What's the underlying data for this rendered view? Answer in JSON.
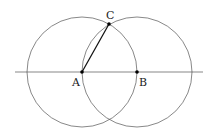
{
  "diagram": {
    "type": "geometric-construction",
    "points": {
      "A": {
        "label": "A",
        "x": 82,
        "y": 72
      },
      "B": {
        "label": "B",
        "x": 137,
        "y": 72
      },
      "C": {
        "label": "C",
        "x": 109,
        "y": 24
      }
    },
    "circles": [
      {
        "center": "A",
        "radius": 55
      },
      {
        "center": "B",
        "radius": 55
      }
    ],
    "line": {
      "x1": 15,
      "y1": 72,
      "x2": 203,
      "y2": 72
    },
    "segment": {
      "from": "A",
      "to": "C"
    },
    "colors": {
      "stroke": "#444444",
      "segment": "#111111",
      "point": "#000000"
    }
  }
}
